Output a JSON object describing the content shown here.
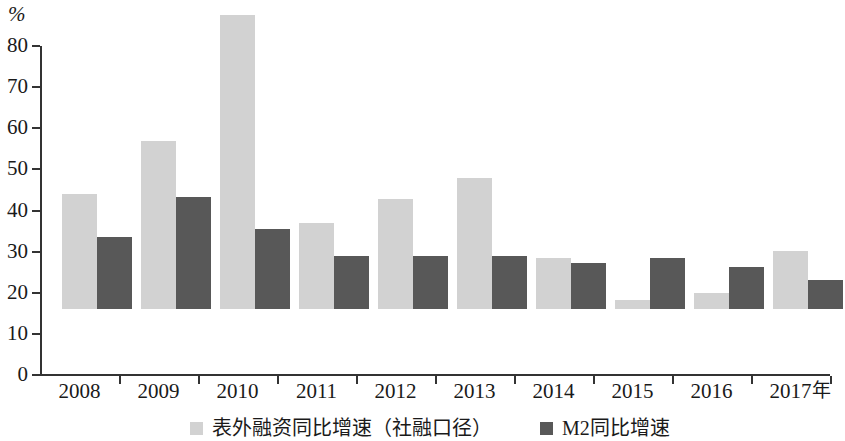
{
  "chart_data": {
    "type": "bar",
    "title": "",
    "subtitle": "",
    "unit_label": "%",
    "xlabel": "年",
    "ylabel": "%",
    "ylim": [
      0,
      80
    ],
    "ytick_step": 10,
    "yticks": [
      0,
      10,
      20,
      30,
      40,
      50,
      60,
      70,
      80
    ],
    "grid": false,
    "legend_position": "bottom",
    "categories": [
      "2008",
      "2009",
      "2010",
      "2011",
      "2012",
      "2013",
      "2014",
      "2015",
      "2016",
      "2017"
    ],
    "series": [
      {
        "name": "表外融资同比增速（社融口径）",
        "color": "#d2d2d2",
        "values": [
          27.9,
          40.8,
          71.4,
          20.8,
          26.8,
          31.8,
          12.3,
          2.1,
          3.8,
          14.0
        ]
      },
      {
        "name": "M2同比增速",
        "color": "#585858",
        "values": [
          17.4,
          27.3,
          19.4,
          12.8,
          13.0,
          12.8,
          11.3,
          12.3,
          10.2,
          7.1
        ]
      }
    ]
  },
  "axis": {
    "unit": "%",
    "x_axis_name": "年"
  },
  "legend": {
    "items": [
      {
        "label": "表外融资同比增速（社融口径）",
        "swatch": "series-0-swatch"
      },
      {
        "label": "M2同比增速",
        "swatch": "series-1-swatch"
      }
    ]
  }
}
